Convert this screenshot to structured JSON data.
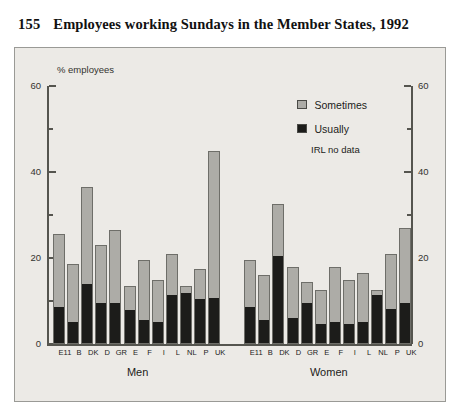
{
  "title": {
    "number": "155",
    "text": "Employees working Sundays in the Member States, 1992"
  },
  "legend": {
    "items": [
      {
        "label": "Sometimes",
        "color": "#adaca7"
      },
      {
        "label": "Usually",
        "color": "#1c1c1a"
      }
    ],
    "note": "IRL no data"
  },
  "axis": {
    "unit_label": "% employees",
    "ticks": [
      "0",
      "20",
      "40",
      "60"
    ]
  },
  "chart_data": {
    "type": "bar",
    "title": "Employees working Sundays in the Member States, 1992",
    "subtitle": "",
    "xlabel": "",
    "ylabel": "% employees",
    "ylim": [
      0,
      60
    ],
    "yticks": [
      0,
      20,
      40,
      60
    ],
    "yminorticks": [
      10,
      30,
      50
    ],
    "grid": false,
    "stacked": true,
    "legend_position": "top-right",
    "annotations": [
      "IRL no data"
    ],
    "groups": [
      {
        "name": "Men",
        "categories": [
          "E11",
          "B",
          "DK",
          "D",
          "GR",
          "E",
          "F",
          "I",
          "L",
          "NL",
          "P",
          "UK"
        ],
        "series": [
          {
            "name": "Usually",
            "values": [
              8.5,
              5.0,
              14.0,
              9.5,
              9.5,
              8.0,
              5.5,
              5.0,
              11.5,
              12.0,
              10.5,
              10.5
            ]
          },
          {
            "name": "Sometimes",
            "values": [
              17.0,
              13.5,
              22.5,
              13.5,
              17.0,
              5.5,
              14.0,
              10.0,
              9.5,
              1.5,
              7.0,
              34.5
            ]
          }
        ],
        "totals": [
          25.5,
          18.5,
          36.5,
          23.0,
          26.5,
          13.5,
          19.5,
          15.0,
          21.0,
          13.5,
          17.5,
          45.0
        ]
      },
      {
        "name": "Women",
        "categories": [
          "E11",
          "B",
          "DK",
          "D",
          "GR",
          "E",
          "F",
          "I",
          "L",
          "NL",
          "P",
          "UK"
        ],
        "series": [
          {
            "name": "Usually",
            "values": [
              8.5,
              5.5,
              20.5,
              6.0,
              9.5,
              4.5,
              5.0,
              4.5,
              5.0,
              11.5,
              8.0,
              9.5
            ]
          },
          {
            "name": "Sometimes",
            "values": [
              11.0,
              10.5,
              12.0,
              12.0,
              5.0,
              8.0,
              13.0,
              10.5,
              11.5,
              1.0,
              13.0,
              17.5
            ]
          }
        ],
        "totals": [
          19.5,
          16.0,
          32.5,
          18.0,
          14.5,
          12.5,
          18.0,
          15.0,
          16.5,
          12.5,
          21.0,
          27.0
        ]
      }
    ]
  }
}
